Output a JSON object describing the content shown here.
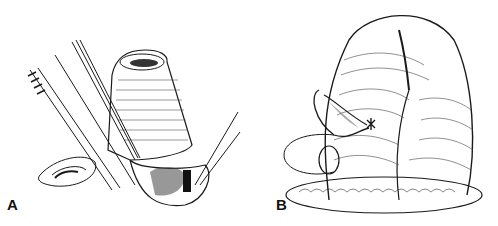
{
  "figure": {
    "panels": [
      {
        "label": "A",
        "description": "Surgical line drawing: forceps and scalpel with cylindrical tissue segment everted over an opening"
      },
      {
        "label": "B",
        "description": "Surgical line drawing: large folded tissue mass with sutured opening and curved needle/suture"
      }
    ],
    "ink_color": "#1a1a1a",
    "background": "#ffffff"
  }
}
